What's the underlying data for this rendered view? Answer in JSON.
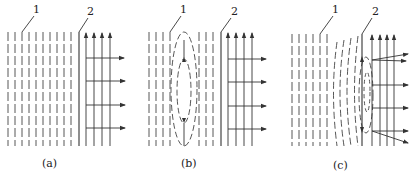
{
  "figure": {
    "panels": [
      {
        "id": "a",
        "caption": "(a)",
        "label1": "1",
        "label2": "2",
        "description": "Uniform field lines (1) adjacent to boundary (2) with parallel upward and rightward arrows"
      },
      {
        "id": "b",
        "caption": "(b)",
        "label1": "1",
        "label2": "2",
        "description": "Field lines with nested elliptical dashed region in the middle of region 1"
      },
      {
        "id": "c",
        "caption": "(c)",
        "label1": "1",
        "label2": "2",
        "description": "Curved dashed lines approaching boundary 2 with ellipse at boundary and diverging arrows"
      }
    ],
    "colors": {
      "line": "#333333",
      "background": "#ffffff"
    }
  }
}
